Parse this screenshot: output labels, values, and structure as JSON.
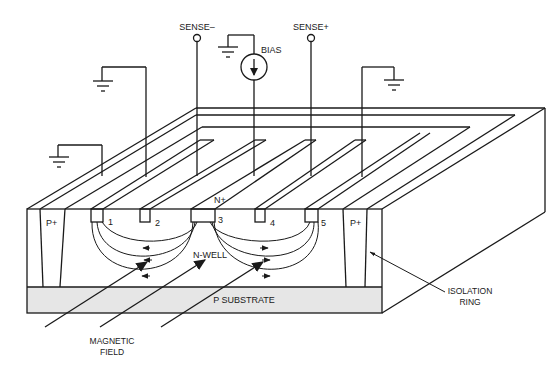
{
  "diagram": {
    "type": "Hall-effect sensor cross-section",
    "colors": {
      "line": "#1a1a1a",
      "substrate_fill": "#e6e6e6",
      "background": "#ffffff"
    },
    "terminals": {
      "sense_minus": "SENSE–",
      "sense_plus": "SENSE+",
      "bias": "BIAS"
    },
    "regions": {
      "n_plus": "N+",
      "n_well": "N-WELL",
      "p_plus_left": "P+",
      "p_plus_right": "P+",
      "p_substrate": "P SUBSTRATE"
    },
    "contacts": [
      "1",
      "2",
      "3",
      "4",
      "5"
    ],
    "annotations": {
      "isolation_ring_line1": "ISOLATION",
      "isolation_ring_line2": "RING",
      "magnetic_field_line1": "MAGNETIC",
      "magnetic_field_line2": "FIELD"
    },
    "ground_symbols": 4
  }
}
